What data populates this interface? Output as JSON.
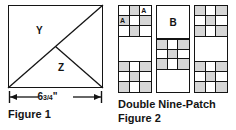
{
  "figure1": {
    "caption": "Figure 1",
    "dimension_value": "6",
    "dimension_fraction": "3/4",
    "dimension_unit": "\"",
    "dimension_full": "6 3/4\"",
    "region_labels": {
      "upper": "Y",
      "lower": "Z"
    },
    "shape": "square-with-diagonals",
    "colors": {
      "stroke": "#141414",
      "fill": "#ffffff"
    }
  },
  "figure2": {
    "title": "Double Nine-Patch",
    "caption": "Figure 2",
    "block_label_b": "B",
    "patch_label_a": "A",
    "colors": {
      "stroke": "#141414",
      "shaded": "#d6d6d6",
      "fill": "#ffffff"
    },
    "strips": [
      {
        "name": "left-strip",
        "blocks": [
          {
            "type": "ninepatch",
            "shaded": [
              1,
              3,
              5,
              7
            ],
            "labels": {
              "2": "A",
              "3": "A"
            }
          },
          {
            "type": "plain"
          },
          {
            "type": "ninepatch",
            "shaded": [
              0,
              2,
              4,
              6,
              8
            ],
            "labels": {}
          }
        ]
      },
      {
        "name": "middle-strip",
        "blocks": [
          {
            "type": "plain-b"
          },
          {
            "type": "ninepatch",
            "shaded": [
              0,
              2,
              4,
              6,
              8
            ],
            "labels": {}
          },
          {
            "type": "plain"
          }
        ]
      },
      {
        "name": "right-strip",
        "blocks": [
          {
            "type": "ninepatch",
            "shaded": [
              0,
              2,
              4,
              6,
              8
            ],
            "labels": {}
          },
          {
            "type": "plain"
          },
          {
            "type": "ninepatch",
            "shaded": [
              0,
              2,
              4,
              6,
              8
            ],
            "labels": {}
          }
        ]
      }
    ]
  }
}
